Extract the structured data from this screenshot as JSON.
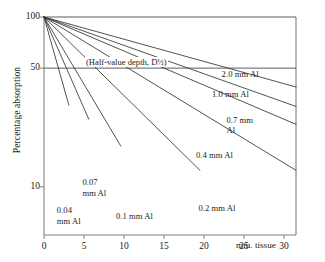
{
  "chart_data": {
    "type": "line",
    "title": "",
    "xlabel": "mm. tissue",
    "ylabel": "Percentage absorption",
    "yscale": "log",
    "xlim": [
      0,
      31.5
    ],
    "ylim": [
      5.2,
      100
    ],
    "grid": false,
    "legend": "inline-labels",
    "xticks": [
      0,
      5,
      10,
      15,
      20,
      25,
      30
    ],
    "xticklabels": [
      "0",
      "5",
      "10",
      "15",
      "20",
      "25",
      "30"
    ],
    "yticks": [
      100,
      50,
      10
    ],
    "yticklabels": [
      "100",
      "50",
      "10"
    ],
    "annotations": [
      {
        "text": "(Half-value depth, D½)",
        "x": 6.0,
        "y": 50,
        "kind": "reference-line-label"
      }
    ],
    "reference_lines": [
      {
        "orientation": "horizontal",
        "y": 50
      },
      {
        "orientation": "horizontal",
        "y": 100
      }
    ],
    "series": [
      {
        "name": "0.04 mm Al",
        "label": "0.04\nmm Al",
        "half_value_depth_mm": 1.8,
        "x": [
          0,
          1.8,
          3.1
        ],
        "values": [
          100,
          50,
          30.5
        ],
        "label_x": 1.6,
        "label_y": 7.2
      },
      {
        "name": "0.07 mm Al",
        "label": "0.07\nmm Al",
        "half_value_depth_mm": 2.8,
        "x": [
          0,
          2.8,
          5.6
        ],
        "values": [
          100,
          50,
          25
        ],
        "label_x": 4.8,
        "label_y": 10.5
      },
      {
        "name": "0.1 mm Al",
        "label": "0.1 mm Al",
        "half_value_depth_mm": 3.8,
        "x": [
          0,
          3.8,
          7.6,
          9.6
        ],
        "values": [
          100,
          50,
          25,
          18.8
        ],
        "label_x": 9.0,
        "label_y": 6.6
      },
      {
        "name": "0.2 mm Al",
        "label": "0.2 mm Al",
        "half_value_depth_mm": 6.5,
        "x": [
          0,
          6.5,
          13,
          19.5
        ],
        "values": [
          100,
          50,
          25,
          12.5
        ],
        "label_x": 19.3,
        "label_y": 7.4
      },
      {
        "name": "0.4 mm Al",
        "label": "0.4 mm Al",
        "half_value_depth_mm": 10.5,
        "x": [
          0,
          10.5,
          21,
          31.5
        ],
        "values": [
          100,
          50,
          25,
          12.5
        ],
        "label_x": 19.0,
        "label_y": 15.2
      },
      {
        "name": "0.7 mm Al",
        "label": "0.7 mm\nAl",
        "half_value_depth_mm": 15.0,
        "x": [
          0,
          15,
          30,
          31.5
        ],
        "values": [
          100,
          50,
          25,
          23.9
        ],
        "label_x": 22.8,
        "label_y": 24.5
      },
      {
        "name": "1.0 mm Al",
        "label": "1.0 mm Al",
        "half_value_depth_mm": 18.0,
        "x": [
          0,
          18,
          31.5
        ],
        "values": [
          100,
          50,
          29.7
        ],
        "label_x": 21.0,
        "label_y": 34.5
      },
      {
        "name": "2.0 mm Al",
        "label": "2.0 mm Al",
        "half_value_depth_mm": 23.0,
        "x": [
          0,
          23,
          31.5
        ],
        "values": [
          100,
          50,
          38.5
        ],
        "label_x": 22.2,
        "label_y": 45.5
      }
    ],
    "colors": {
      "line": "#333333",
      "axis": "#808080",
      "text": "#1a1a1a",
      "background": "#ffffff"
    }
  }
}
